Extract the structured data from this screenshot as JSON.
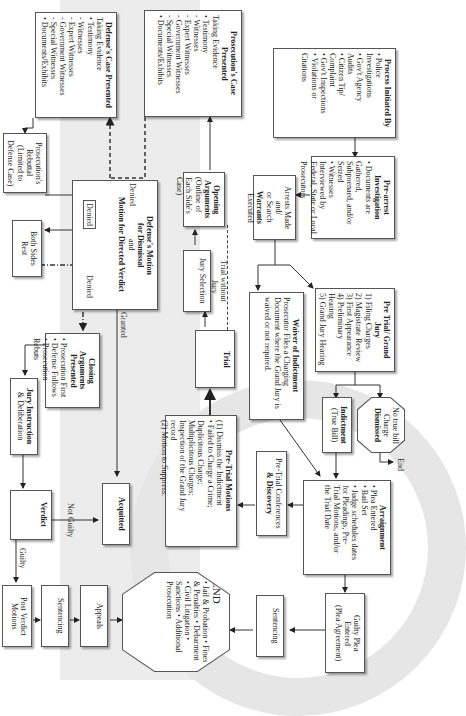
{
  "diagram": {
    "orientation": "rotated-90-clockwise",
    "nodes": {
      "process_initiated": {
        "title": "Process Initiated By",
        "items": [
          "• Police",
          "  Investigations",
          "• Gov't Agency",
          "  Audits",
          "• Citizen Tip/",
          "  Complaint",
          "• Gov't Inspections",
          "• Violations or",
          "  Citations"
        ]
      },
      "pre_arrest": {
        "title": "Pre-arrest Investigation",
        "items": [
          "• Documents are Gathered,",
          "  Subpoenaed, and/or Seized",
          "• Witnesses Interviewed by",
          "  Federal, State or Local",
          "  Prosecutors"
        ]
      },
      "arrests": {
        "line1": "Arrests Made and/",
        "line2": "or Search",
        "title": "Warrants",
        "line3": "Executed"
      },
      "pretrial_grand_jury": {
        "title": "Pre Trial/ Grand Jury",
        "items": [
          "1) Filing Charges",
          "2) Magistrate Review",
          "3) First Appearance",
          "4) Preliminary Hearing",
          "5) Grand Jury Hearing"
        ]
      },
      "waiver": {
        "title": "Waiver of Indictment",
        "text": "Prosecutor Files a Charging Document where the Grand Jury is waived or not required."
      },
      "no_true_bill": {
        "lines": [
          "No true bill",
          "Charge",
          "Dismissed"
        ]
      },
      "end_small": {
        "label": "End"
      },
      "indictment": {
        "title": "Indictment",
        "sub": "(True Bill)"
      },
      "arraignment": {
        "title": "Arraignment",
        "items": [
          "• Plea Entered",
          "• Bail Set",
          "• Judge schedules dates",
          "  for Pleadings, Pre-",
          "  Trial Motions, and/or",
          "  the Trial Date"
        ]
      },
      "guilty_plea": {
        "lines": [
          "Guilty Plea",
          "Entered",
          "(Plea Agreement)"
        ]
      },
      "pretrial_conferences": {
        "line1": "Pre-Trial Conferences",
        "line2": "& Discovery"
      },
      "pretrial_motions": {
        "title": "Pre-Trial Motions",
        "items": [
          "(1) Dismiss the Indictment",
          "  • Failed to Charge a Crime;",
          "    Duplicitous Charge;",
          "    Multiplicitous Charges;",
          "    Inspection of the Grand Jury",
          "    record",
          "(2) Motion to Suppress."
        ]
      },
      "sentencing_right": {
        "label": "Sentencing"
      },
      "end_big": {
        "title": "END",
        "items": [
          "• Jail & Probation",
          "• Fines &",
          "  Penalties",
          "• Debarment",
          "• Civil Litigation",
          "• Sanctions",
          "• Additional",
          "  Prosecution"
        ]
      },
      "trial": {
        "label": "Trial"
      },
      "jury_selection": {
        "label": "Jury Selection"
      },
      "trial_without_jury": {
        "line1": "Trial without",
        "line2": "Jury"
      },
      "opening_arguments": {
        "title": "Opening",
        "title2": "Arguments",
        "sub": "(Outline of Each Side's Case)"
      },
      "prosecution_case": {
        "title": "Prosecution's Case Presented",
        "items": [
          "Taking Evidence",
          "• Testimony",
          "  - Witnesses",
          "  - Expert Witnesses",
          "  - Government Witnesses",
          "  - Special Witnesses",
          "• Documents/Exhibits"
        ]
      },
      "defense_case": {
        "title": "Defense's Case Presented",
        "items": [
          "Taking Evidence",
          "• Testimony",
          "  - Witnesses",
          "  - Expert Witnesses",
          "  - Government Witnesses",
          "  - Special Witnesses",
          "• Documents/Exhibits"
        ]
      },
      "rebuttal": {
        "lines": [
          "Prosecution's",
          "Rebuttal",
          "(Limited to",
          "Defense Case)"
        ]
      },
      "motion_dismissal": {
        "line1": "Defense's Motion",
        "line2": "for Dismissal",
        "and": "and",
        "line3": "Motion for Directed Verdict"
      },
      "both_sides_rest": {
        "lines": [
          "Both Sides",
          "Rest"
        ]
      },
      "closing_arguments": {
        "title": "Closing Arguments Presented",
        "items": [
          "• Prosecution First",
          "• Defense Follows",
          "• Prosecution Rebuts"
        ]
      },
      "acquitted": {
        "label": "Acquitted"
      },
      "jury_instruction": {
        "line1": "Jury Instruction",
        "line2": "& Deliberation"
      },
      "verdict": {
        "label": "Verdict"
      },
      "post_verdict": {
        "lines": [
          "Post Verdict",
          "Motions"
        ]
      },
      "sentencing_left": {
        "label": "Sentencing"
      },
      "appeals": {
        "label": "Appeals"
      }
    },
    "edge_labels": {
      "denied_1": "Denied",
      "denied_2": "Denied",
      "denied_3": "Denied",
      "granted": "Granted",
      "not_guilty": "Not Guilty",
      "guilty": "Guilty"
    },
    "colors": {
      "border": "#555555",
      "line": "#333333",
      "background_band": "#ececec"
    }
  }
}
